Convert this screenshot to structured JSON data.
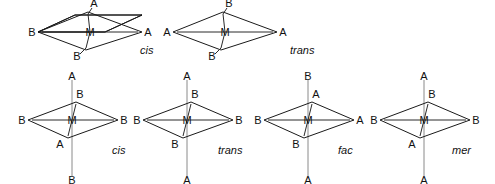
{
  "figure": {
    "background_color": "#ffffff",
    "label_color": "#111111",
    "axis_color": "#8a8a8a",
    "bond_color": "#2a2a2a",
    "plane_fill_dark": "#3c3c3c",
    "plane_fill_light": "#e8e8e8"
  },
  "rows": [
    {
      "row_name": "square-planar",
      "structures": [
        {
          "id": "sp-cis",
          "name": "cis",
          "metal": "M",
          "geometry": "square planar",
          "vertices": {
            "left": "B",
            "right": "A",
            "back": "A",
            "front": "B"
          }
        },
        {
          "id": "sp-trans",
          "name": "trans",
          "metal": "M",
          "geometry": "square planar",
          "vertices": {
            "left": "A",
            "right": "A",
            "back": "B",
            "front": "B"
          }
        }
      ]
    },
    {
      "row_name": "octahedral",
      "structures": [
        {
          "id": "oct-cis",
          "name": "cis",
          "metal": "M",
          "geometry": "octahedral",
          "vertices": {
            "top": "A",
            "bottom": "B",
            "left": "B",
            "right": "B",
            "back": "B",
            "front": "A"
          }
        },
        {
          "id": "oct-trans",
          "name": "trans",
          "metal": "M",
          "geometry": "octahedral",
          "vertices": {
            "top": "A",
            "bottom": "A",
            "left": "B",
            "right": "B",
            "back": "B",
            "front": "B"
          }
        },
        {
          "id": "oct-fac",
          "name": "fac",
          "metal": "M",
          "geometry": "octahedral",
          "vertices": {
            "top": "B",
            "bottom": "A",
            "left": "B",
            "right": "A",
            "back": "A",
            "front": "B"
          }
        },
        {
          "id": "oct-mer",
          "name": "mer",
          "metal": "M",
          "geometry": "octahedral",
          "vertices": {
            "top": "A",
            "bottom": "A",
            "left": "B",
            "right": "B",
            "back": "B",
            "front": "A"
          }
        }
      ]
    }
  ]
}
